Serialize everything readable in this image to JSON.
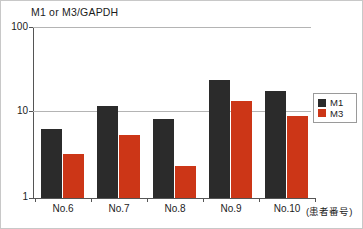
{
  "chart_data": {
    "type": "bar",
    "title": "M1 or M3/GAPDH",
    "xlabel": "(患者番号)",
    "ylabel": "",
    "yscale": "log",
    "ylim": [
      1,
      100
    ],
    "yticks": [
      "1",
      "10",
      "100"
    ],
    "grid": "horizontal",
    "legend_position": "right",
    "categories": [
      "No.6",
      "No.7",
      "No.8",
      "No.9",
      "No.10"
    ],
    "series": [
      {
        "name": "M1",
        "color": "#2b2b2b",
        "values": [
          6.5,
          12.0,
          8.5,
          24.0,
          18.0
        ]
      },
      {
        "name": "M3",
        "color": "#cc3617",
        "values": [
          3.3,
          5.5,
          2.4,
          13.5,
          9.0
        ]
      }
    ]
  },
  "legend": {
    "items": [
      {
        "label": "M1"
      },
      {
        "label": "M3"
      }
    ]
  }
}
